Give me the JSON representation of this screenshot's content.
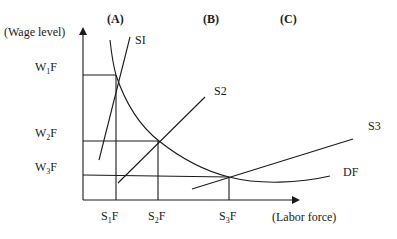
{
  "diagram": {
    "type": "labor-market-supply-demand",
    "y_axis_label": "(Wage level)",
    "x_axis_label": "(Labor force)",
    "regions": [
      {
        "id": "A",
        "label": "(A)"
      },
      {
        "id": "B",
        "label": "(B)"
      },
      {
        "id": "C",
        "label": "(C)"
      }
    ],
    "wage_levels": [
      {
        "main": "W",
        "sub": "1",
        "suffix": "F"
      },
      {
        "main": "W",
        "sub": "2",
        "suffix": "F"
      },
      {
        "main": "W",
        "sub": "3",
        "suffix": "F"
      }
    ],
    "labor_levels": [
      {
        "main": "S",
        "sub": "1",
        "suffix": "F"
      },
      {
        "main": "S",
        "sub": "2",
        "suffix": "F"
      },
      {
        "main": "S",
        "sub": "3",
        "suffix": "F"
      }
    ],
    "curves": {
      "supply_1": "SI",
      "supply_2": "S2",
      "supply_3": "S3",
      "demand": "DF"
    },
    "equilibria": [
      {
        "region": "A",
        "wage": "W1F",
        "labor": "S1F"
      },
      {
        "region": "B",
        "wage": "W2F",
        "labor": "S2F"
      },
      {
        "region": "C",
        "wage": "W3F",
        "labor": "S3F"
      }
    ]
  }
}
